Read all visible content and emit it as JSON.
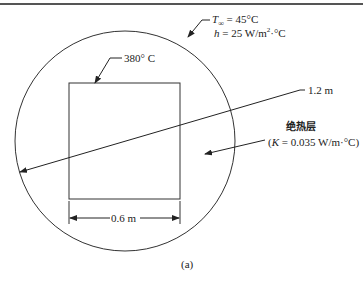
{
  "diagram": {
    "type": "cross-section",
    "shapes": {
      "circle": {
        "cx": 125,
        "cy": 141,
        "r": 110
      },
      "square": {
        "x": 69,
        "y": 83,
        "w": 111,
        "h": 116
      }
    },
    "labels": {
      "t_inf_sym": "T",
      "t_inf_sub": "∞",
      "t_inf_val": " = 45°C",
      "h_sym": "h",
      "h_val": " = 25 W/m",
      "h_sup": "2",
      "h_tail": "·°C",
      "surface_temp": "380° C",
      "diameter": "1.2 m",
      "insulation_cn": "绝热层",
      "k_open": "(",
      "k_sym": "K",
      "k_val": " = 0.035 W/m·°C)",
      "width": "0.6 m",
      "caption": "(a)"
    },
    "colors": {
      "line": "#333333",
      "border": "#555555"
    }
  }
}
